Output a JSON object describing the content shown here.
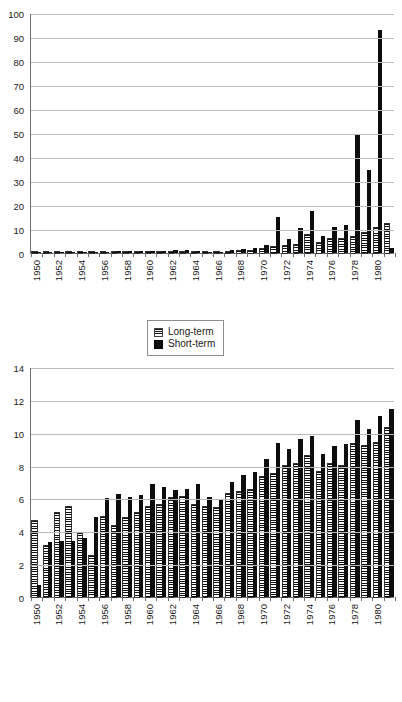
{
  "page": {
    "clipped_header_text": ""
  },
  "legend": {
    "long_label": "Long-term",
    "short_label": "Short-term"
  },
  "chart_data": [
    {
      "type": "bar",
      "id": "top-chart",
      "title": "",
      "xlabel": "",
      "ylabel": "",
      "ylim": [
        0,
        100
      ],
      "yticks": [
        0,
        10,
        20,
        30,
        40,
        50,
        60,
        70,
        80,
        90,
        100
      ],
      "grid": true,
      "legend_position": "bottom-center",
      "categories": [
        "1950",
        "1951",
        "1952",
        "1953",
        "1954",
        "1955",
        "1956",
        "1957",
        "1958",
        "1959",
        "1960",
        "1961",
        "1962",
        "1963",
        "1964",
        "1965",
        "1966",
        "1967",
        "1968",
        "1969",
        "1970",
        "1971",
        "1972",
        "1973",
        "1974",
        "1975",
        "1976",
        "1977",
        "1978",
        "1979",
        "1980",
        "1981"
      ],
      "tick_labels": [
        "1950",
        "",
        "1952",
        "",
        "1954",
        "",
        "1956",
        "",
        "1958",
        "",
        "1960",
        "",
        "1962",
        "",
        "1964",
        "",
        "1966",
        "",
        "1968",
        "",
        "1970",
        "",
        "1972",
        "",
        "1974",
        "",
        "1976",
        "",
        "1978",
        "",
        "1980",
        ""
      ],
      "series": [
        {
          "name": "Long-term",
          "values": [
            0.1,
            0.1,
            0.1,
            0.1,
            0.2,
            0.2,
            0.2,
            0.3,
            0.3,
            0.3,
            0.4,
            0.4,
            0.4,
            0.4,
            0.4,
            0.3,
            0.3,
            0.6,
            0.9,
            1.0,
            1.6,
            2.6,
            3.0,
            3.3,
            7.5,
            4.0,
            5.8,
            6.0,
            6.6,
            8.3,
            10.3,
            12.0
          ]
        },
        {
          "name": "Short-term",
          "values": [
            0.1,
            0.1,
            0.1,
            0.2,
            0.4,
            0.5,
            0.6,
            0.8,
            0.8,
            0.9,
            1.0,
            1.0,
            1.1,
            1.1,
            1.0,
            0.6,
            0.5,
            1.2,
            1.8,
            2.1,
            3.2,
            15.0,
            6.0,
            10.5,
            17.5,
            7.0,
            11.0,
            11.5,
            49.0,
            34.5,
            93.0,
            2.0
          ]
        }
      ]
    },
    {
      "type": "bar",
      "id": "bottom-chart",
      "title": "",
      "xlabel": "",
      "ylabel": "",
      "ylim": [
        0,
        14
      ],
      "yticks": [
        0,
        2,
        4,
        6,
        8,
        10,
        12,
        14
      ],
      "grid": true,
      "legend_position": "bottom-center",
      "categories": [
        "1950",
        "1951",
        "1952",
        "1953",
        "1954",
        "1955",
        "1956",
        "1957",
        "1958",
        "1959",
        "1960",
        "1961",
        "1962",
        "1963",
        "1964",
        "1965",
        "1966",
        "1967",
        "1968",
        "1969",
        "1970",
        "1971",
        "1972",
        "1973",
        "1974",
        "1975",
        "1976",
        "1977",
        "1978",
        "1979",
        "1980",
        "1981"
      ],
      "tick_labels": [
        "1950",
        "",
        "1952",
        "",
        "1954",
        "",
        "1956",
        "",
        "1958",
        "",
        "1960",
        "",
        "1962",
        "",
        "1964",
        "",
        "1966",
        "",
        "1968",
        "",
        "1970",
        "",
        "1972",
        "",
        "1974",
        "",
        "1976",
        "",
        "1978",
        "",
        "1980",
        ""
      ],
      "series": [
        {
          "name": "Long-term",
          "values": [
            4.6,
            3.1,
            5.1,
            5.5,
            3.9,
            2.5,
            4.9,
            4.3,
            4.8,
            5.1,
            5.5,
            5.6,
            6.0,
            6.1,
            5.6,
            5.5,
            5.4,
            6.3,
            6.4,
            6.5,
            7.3,
            7.5,
            8.0,
            8.1,
            8.6,
            7.6,
            8.1,
            8.0,
            9.3,
            9.2,
            9.4,
            10.3
          ]
        },
        {
          "name": "Short-term",
          "values": [
            0.75,
            3.35,
            3.4,
            3.4,
            3.6,
            4.85,
            6.05,
            6.25,
            6.1,
            6.2,
            6.85,
            6.7,
            6.5,
            6.6,
            6.9,
            6.1,
            5.9,
            7.0,
            7.4,
            7.6,
            8.4,
            9.35,
            9.0,
            9.6,
            9.8,
            8.7,
            9.2,
            9.3,
            10.8,
            10.2,
            11.0,
            11.45
          ]
        }
      ]
    }
  ]
}
